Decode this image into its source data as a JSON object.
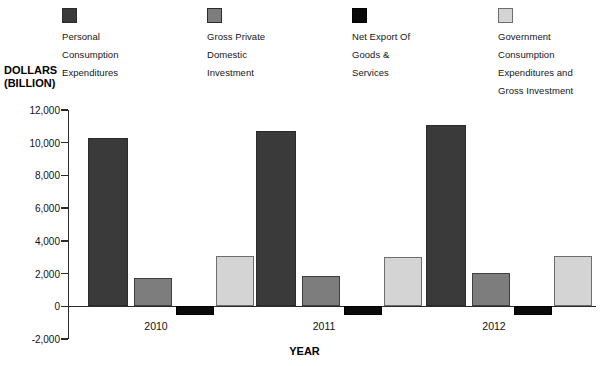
{
  "chart_data": {
    "type": "bar",
    "title": "",
    "xlabel": "YEAR",
    "ylabel": "DOLLARS\n(BILLION)",
    "categories": [
      "2010",
      "2011",
      "2012"
    ],
    "ylim": [
      -2000,
      12000
    ],
    "ytick_labels": [
      "12,000",
      "10,000",
      "8,000",
      "6,000",
      "4,000",
      "2,000",
      "0",
      "-2,000"
    ],
    "ytick_values": [
      12000,
      10000,
      8000,
      6000,
      4000,
      2000,
      0,
      -2000
    ],
    "grid": false,
    "legend_position": "top",
    "series": [
      {
        "name": "Personal\nConsumption\nExpenditures",
        "color": "#3a3a3a",
        "border": "#2b2b2b",
        "values": [
          10300,
          10700,
          11100
        ]
      },
      {
        "name": "Gross Private\nDomestic\nInvestment",
        "color": "#7d7d7d",
        "border": "#3f3f3f",
        "values": [
          1750,
          1860,
          2050
        ]
      },
      {
        "name": "Net Export Of\nGoods &\nServices",
        "color": "#0a0a0a",
        "border": "#000000",
        "values": [
          -510,
          -560,
          -540
        ]
      },
      {
        "name": "Government\nConsumption\nExpenditures and\nGross Investment",
        "color": "#d4d4d4",
        "border": "#6e6e6e",
        "values": [
          3050,
          3040,
          3100
        ]
      }
    ]
  },
  "legend": {
    "items": [
      {
        "label": "Personal\nConsumption\nExpenditures",
        "color": "#3a3a3a"
      },
      {
        "label": "Gross Private\nDomestic\nInvestment",
        "color": "#7d7d7d"
      },
      {
        "label": "Net Export Of\nGoods &\nServices",
        "color": "#0a0a0a"
      },
      {
        "label": "Government\nConsumption\nExpenditures and\nGross Investment",
        "color": "#d4d4d4"
      }
    ]
  }
}
